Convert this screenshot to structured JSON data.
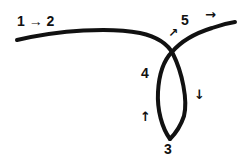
{
  "diagram": {
    "labels": {
      "start": "1 → 2",
      "crossing": "5",
      "left_side": "4",
      "bottom": "3"
    },
    "arrows": {
      "near_crossing": "↗",
      "exit": "→",
      "loop_right_down": "↓",
      "loop_left_up": "↑"
    },
    "points": {
      "1": "start of curve (left)",
      "2": "along incoming curve",
      "5": "self-crossing point",
      "3": "bottom of loop",
      "4": "left side of loop (returning up)"
    },
    "stroke_color": "#111111",
    "background_color": "#ffffff"
  }
}
